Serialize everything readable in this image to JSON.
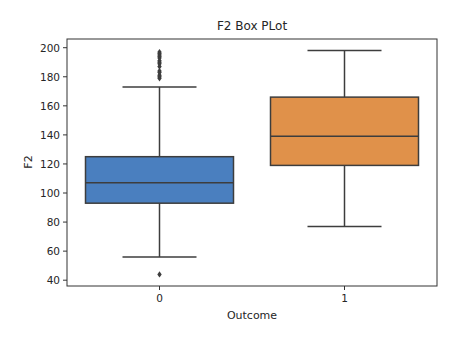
{
  "chart_data": {
    "type": "box",
    "title": "F2 Box PLot",
    "xlabel": "Outcome",
    "ylabel": "F2",
    "categories": [
      "0",
      "1"
    ],
    "ylim": [
      36,
      206
    ],
    "yticks": [
      40,
      60,
      80,
      100,
      120,
      140,
      160,
      180,
      200
    ],
    "grid": false,
    "legend": null,
    "series": [
      {
        "name": "0",
        "color": "#4a7fbf",
        "whisker_low": 56,
        "q1": 93,
        "median": 107,
        "q3": 125,
        "whisker_high": 173,
        "outliers": [
          44,
          179,
          180,
          181,
          183,
          184,
          187,
          189,
          190,
          191,
          193,
          194,
          195,
          196,
          197
        ]
      },
      {
        "name": "1",
        "color": "#e0914a",
        "whisker_low": 77,
        "q1": 119,
        "median": 139,
        "q3": 166,
        "whisker_high": 198,
        "outliers": []
      }
    ]
  }
}
